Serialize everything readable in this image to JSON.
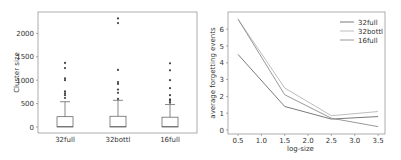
{
  "chart_data": [
    {
      "type": "box",
      "title": "",
      "xlabel": "",
      "ylabel": "Cluster size",
      "categories": [
        "32full",
        "32bottl",
        "16full"
      ],
      "yticks": [
        0,
        500,
        1000,
        1500,
        2000
      ],
      "ylim": [
        -100,
        2450
      ],
      "grid": false,
      "boxes": [
        {
          "name": "32full",
          "min": 0,
          "q1": 5,
          "median": 10,
          "q3": 220,
          "whisker_high": 540,
          "outliers": [
            620,
            680,
            720,
            760,
            1000,
            1040,
            1260,
            1370
          ]
        },
        {
          "name": "32bottl",
          "min": 0,
          "q1": 5,
          "median": 10,
          "q3": 230,
          "whisker_high": 570,
          "outliers": [
            600,
            730,
            800,
            920,
            960,
            1220,
            2220,
            2320
          ]
        },
        {
          "name": "16full",
          "min": 0,
          "q1": 5,
          "median": 10,
          "q3": 210,
          "whisker_high": 480,
          "outliers": [
            520,
            560,
            590,
            680,
            830,
            1000,
            1210,
            1360
          ]
        }
      ]
    },
    {
      "type": "line",
      "title": "",
      "xlabel": "log-size",
      "ylabel": "average forgetting events",
      "x": [
        0.5,
        1.5,
        2.5,
        3.5
      ],
      "xticks": [
        0.5,
        1.0,
        1.5,
        2.0,
        2.5,
        3.0,
        3.5
      ],
      "yticks": [
        0,
        1,
        2,
        3,
        4,
        5,
        6
      ],
      "xlim": [
        0.35,
        3.6
      ],
      "ylim": [
        -0.2,
        7.0
      ],
      "grid": false,
      "legend_position": "upper right",
      "series": [
        {
          "name": "32full",
          "color": "#6b6b6b",
          "values": [
            4.5,
            1.4,
            0.65,
            0.8
          ]
        },
        {
          "name": "32bottl",
          "color": "#b5b5b5",
          "values": [
            6.6,
            2.5,
            0.85,
            1.1
          ]
        },
        {
          "name": "16full",
          "color": "#8c8c8c",
          "values": [
            6.6,
            2.1,
            0.7,
            0.2
          ]
        }
      ]
    }
  ]
}
